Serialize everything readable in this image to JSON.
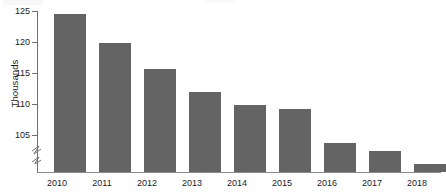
{
  "chart_data": {
    "type": "bar",
    "title": "",
    "subtitle": "",
    "xlabel": "",
    "ylabel": "Thousands",
    "categories": [
      "2010",
      "2011",
      "2012",
      "2013",
      "2014",
      "2015",
      "2016",
      "2017",
      "2018"
    ],
    "values": [
      123.2,
      119.4,
      116.0,
      112.9,
      111.3,
      110.7,
      106.3,
      105.3,
      103.6
    ],
    "series": [
      {
        "name": "",
        "values": [
          123.2,
          119.4,
          116.0,
          112.9,
          111.3,
          110.7,
          106.3,
          105.3,
          103.6
        ]
      }
    ],
    "ylim": [
      102.5,
      125
    ],
    "yticks": [
      105,
      110,
      115,
      120,
      125
    ],
    "ytick_labels": [
      "105",
      "110",
      "115",
      "120",
      "125"
    ],
    "xtick_labels": [
      "2010",
      "2011",
      "2012",
      "2013",
      "2014",
      "2015",
      "2016",
      "2017",
      "2018"
    ],
    "grid": false,
    "legend": null,
    "legend_position": "none",
    "axis_break": true,
    "axis_break_note": "y-axis broken below 105",
    "bar_color": "#646464",
    "axis_color": "#6f6f6f",
    "text_color": "#1a1a1a"
  },
  "annotations": {
    "watermark": "·"
  }
}
